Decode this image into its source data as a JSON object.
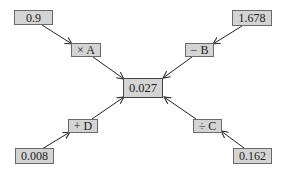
{
  "diagram": {
    "center": {
      "label": "0.027"
    },
    "inputs": [
      {
        "id": "tl",
        "value": "0.9",
        "operator": "× A"
      },
      {
        "id": "tr",
        "value": "1.678",
        "operator": "− B"
      },
      {
        "id": "br",
        "value": "0.162",
        "operator": "÷ C"
      },
      {
        "id": "bl",
        "value": "0.008",
        "operator": "+ D"
      }
    ],
    "colors": {
      "box_fill": "#d4d4d4",
      "box_border": "#6a6a6a",
      "arrow": "#222222"
    }
  }
}
